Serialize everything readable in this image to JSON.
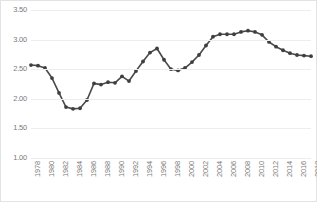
{
  "chart_data": {
    "type": "line",
    "title": "",
    "xlabel": "",
    "ylabel": "",
    "ylim": [
      1.0,
      3.5
    ],
    "ytick_step": 0.5,
    "ytick_labels": [
      "3.50",
      "3.00",
      "2.50",
      "2.00",
      "1.50",
      "1.00"
    ],
    "ytick_values": [
      3.5,
      3.0,
      2.5,
      2.0,
      1.5,
      1.0
    ],
    "grid": true,
    "legend": "none",
    "marker": "circle",
    "line_color": "#4a4a4a",
    "marker_color": "#3f3f3f",
    "grid_color": "#ededed",
    "tick_label_color": "#7a7a7a",
    "x_tick_rotation": -90,
    "x_tick_interval": 2,
    "xlim": [
      1978,
      2018
    ],
    "x_tick_labels": [
      "1978",
      "1980",
      "1982",
      "1984",
      "1986",
      "1988",
      "1990",
      "1992",
      "1994",
      "1996",
      "1998",
      "2000",
      "2002",
      "2004",
      "2006",
      "2008",
      "2010",
      "2012",
      "2014",
      "2016",
      "2018"
    ],
    "x": [
      1978,
      1979,
      1980,
      1981,
      1982,
      1983,
      1984,
      1985,
      1986,
      1987,
      1988,
      1989,
      1990,
      1991,
      1992,
      1993,
      1994,
      1995,
      1996,
      1997,
      1998,
      1999,
      2000,
      2001,
      2002,
      2003,
      2004,
      2005,
      2006,
      2007,
      2008,
      2009,
      2010,
      2011,
      2012,
      2013,
      2014,
      2015,
      2016,
      2017,
      2018
    ],
    "values": [
      2.57,
      2.56,
      2.52,
      2.35,
      2.1,
      1.86,
      1.83,
      1.84,
      1.98,
      2.26,
      2.24,
      2.28,
      2.27,
      2.38,
      2.3,
      2.47,
      2.63,
      2.78,
      2.85,
      2.66,
      2.5,
      2.48,
      2.52,
      2.62,
      2.74,
      2.9,
      3.05,
      3.09,
      3.09,
      3.09,
      3.13,
      3.15,
      3.13,
      3.08,
      2.96,
      2.88,
      2.82,
      2.77,
      2.74,
      2.73,
      2.72
    ]
  }
}
